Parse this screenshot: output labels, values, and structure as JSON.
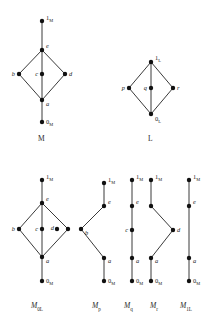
{
  "figure": {
    "type": "hasse-diagram-set",
    "background": "#ffffff",
    "ink": "#1a1a1a",
    "captions": {
      "M": "M",
      "L": "L",
      "M0L": {
        "base": "M",
        "sub": "0",
        "subsub": "L"
      },
      "Mp": {
        "base": "M",
        "sub": "p"
      },
      "Mq": {
        "base": "M",
        "sub": "q"
      },
      "Mr": {
        "base": "M",
        "sub": "r"
      },
      "M1L": {
        "base": "M",
        "sub": "1",
        "subsub": "L"
      }
    },
    "diagrams": [
      {
        "id": "M",
        "caption": "M",
        "caption_pos": {
          "x": 38,
          "y": 140
        },
        "nodes": [
          {
            "id": "one",
            "label": "1",
            "sub": "M",
            "x": 42,
            "y": 21,
            "label_dx": 4,
            "label_dy": -1,
            "anchor": "start"
          },
          {
            "id": "e",
            "label": "e",
            "sub": "",
            "x": 42,
            "y": 50,
            "label_dx": 4,
            "label_dy": -2,
            "anchor": "start"
          },
          {
            "id": "b",
            "label": "b",
            "sub": "",
            "x": 19,
            "y": 74,
            "label_dx": -4,
            "label_dy": 2,
            "anchor": "end"
          },
          {
            "id": "c",
            "label": "c",
            "sub": "",
            "x": 42,
            "y": 74,
            "label_dx": -4,
            "label_dy": 2,
            "anchor": "end"
          },
          {
            "id": "d",
            "label": "d",
            "sub": "",
            "x": 65,
            "y": 74,
            "label_dx": 4,
            "label_dy": 2,
            "anchor": "start"
          },
          {
            "id": "a",
            "label": "a",
            "sub": "",
            "x": 42,
            "y": 100,
            "label_dx": 4,
            "label_dy": 6,
            "anchor": "start"
          },
          {
            "id": "zero",
            "label": "0",
            "sub": "M",
            "x": 42,
            "y": 122,
            "label_dx": 4,
            "label_dy": 2,
            "anchor": "start"
          }
        ],
        "edges": [
          [
            "one",
            "e"
          ],
          [
            "e",
            "b"
          ],
          [
            "e",
            "c"
          ],
          [
            "e",
            "d"
          ],
          [
            "b",
            "a"
          ],
          [
            "c",
            "a"
          ],
          [
            "d",
            "a"
          ],
          [
            "a",
            "zero"
          ]
        ]
      },
      {
        "id": "L",
        "caption": "L",
        "caption_pos": {
          "x": 148,
          "y": 140
        },
        "nodes": [
          {
            "id": "one",
            "label": "1",
            "sub": "L",
            "x": 151,
            "y": 62,
            "label_dx": 4,
            "label_dy": -2,
            "anchor": "start"
          },
          {
            "id": "p",
            "label": "p",
            "sub": "",
            "x": 129,
            "y": 88,
            "label_dx": -4,
            "label_dy": 2,
            "anchor": "end"
          },
          {
            "id": "q",
            "label": "q",
            "sub": "",
            "x": 151,
            "y": 88,
            "label_dx": -4,
            "label_dy": 2,
            "anchor": "end"
          },
          {
            "id": "r",
            "label": "r",
            "sub": "",
            "x": 173,
            "y": 88,
            "label_dx": 4,
            "label_dy": 2,
            "anchor": "start"
          },
          {
            "id": "zero",
            "label": "0",
            "sub": "L",
            "x": 151,
            "y": 114,
            "label_dx": 4,
            "label_dy": 7,
            "anchor": "start"
          }
        ],
        "edges": [
          [
            "one",
            "p"
          ],
          [
            "one",
            "q"
          ],
          [
            "one",
            "r"
          ],
          [
            "p",
            "zero"
          ],
          [
            "q",
            "zero"
          ],
          [
            "r",
            "zero"
          ]
        ]
      },
      {
        "id": "M0L",
        "caption_pos": {
          "x": 31,
          "y": 307
        },
        "nodes": [
          {
            "id": "one",
            "label": "1",
            "sub": "M",
            "x": 42,
            "y": 180,
            "label_dx": 4,
            "label_dy": -1,
            "anchor": "start"
          },
          {
            "id": "e",
            "label": "e",
            "sub": "",
            "x": 42,
            "y": 203,
            "label_dx": 4,
            "label_dy": -2,
            "anchor": "start"
          },
          {
            "id": "b",
            "label": "b",
            "sub": "",
            "x": 19,
            "y": 229,
            "label_dx": -4,
            "label_dy": 2,
            "anchor": "end"
          },
          {
            "id": "c",
            "label": "c",
            "sub": "",
            "x": 42,
            "y": 229,
            "label_dx": -4,
            "label_dy": 2,
            "anchor": "end"
          },
          {
            "id": "d",
            "label": "d",
            "sub": "",
            "x": 57,
            "y": 229,
            "label_dx": -3,
            "label_dy": 1,
            "anchor": "end"
          },
          {
            "id": "dx",
            "label": "",
            "sub": "",
            "x": 68,
            "y": 229,
            "label_dx": 0,
            "label_dy": 0,
            "anchor": "start"
          },
          {
            "id": "a",
            "label": "a",
            "sub": "",
            "x": 42,
            "y": 257,
            "label_dx": 4,
            "label_dy": 6,
            "anchor": "start"
          },
          {
            "id": "zero",
            "label": "0",
            "sub": "M",
            "x": 42,
            "y": 281,
            "label_dx": 4,
            "label_dy": 2,
            "anchor": "start"
          }
        ],
        "edges": [
          [
            "one",
            "e"
          ],
          [
            "e",
            "b"
          ],
          [
            "e",
            "c"
          ],
          [
            "e",
            "dx"
          ],
          [
            "b",
            "a"
          ],
          [
            "c",
            "a"
          ],
          [
            "dx",
            "a"
          ],
          [
            "a",
            "zero"
          ]
        ]
      },
      {
        "id": "Mp",
        "caption_pos": {
          "x": 92,
          "y": 307
        },
        "nodes": [
          {
            "id": "one",
            "label": "1",
            "sub": "M",
            "x": 104,
            "y": 183,
            "label_dx": 4,
            "label_dy": -1,
            "anchor": "start"
          },
          {
            "id": "e",
            "label": "e",
            "sub": "",
            "x": 104,
            "y": 206,
            "label_dx": 4,
            "label_dy": -2,
            "anchor": "start"
          },
          {
            "id": "b",
            "label": "b",
            "sub": "",
            "x": 81,
            "y": 229,
            "label_dx": 4,
            "label_dy": 6,
            "anchor": "start"
          },
          {
            "id": "a",
            "label": "a",
            "sub": "",
            "x": 104,
            "y": 258,
            "label_dx": 4,
            "label_dy": 5,
            "anchor": "start"
          },
          {
            "id": "zero",
            "label": "0",
            "sub": "M",
            "x": 104,
            "y": 281,
            "label_dx": 4,
            "label_dy": 2,
            "anchor": "start"
          }
        ],
        "edges": [
          [
            "one",
            "e"
          ],
          [
            "e",
            "b"
          ],
          [
            "b",
            "a"
          ],
          [
            "a",
            "zero"
          ]
        ]
      },
      {
        "id": "Mq",
        "caption_pos": {
          "x": 124,
          "y": 307
        },
        "nodes": [
          {
            "id": "one",
            "label": "1",
            "sub": "M",
            "x": 132,
            "y": 180,
            "label_dx": 4,
            "label_dy": -1,
            "anchor": "start"
          },
          {
            "id": "e",
            "label": "e",
            "sub": "",
            "x": 132,
            "y": 206,
            "label_dx": 4,
            "label_dy": -2,
            "anchor": "start"
          },
          {
            "id": "c",
            "label": "c",
            "sub": "",
            "x": 132,
            "y": 230,
            "label_dx": -4,
            "label_dy": 2,
            "anchor": "end"
          },
          {
            "id": "a",
            "label": "a",
            "sub": "",
            "x": 132,
            "y": 258,
            "label_dx": 4,
            "label_dy": 5,
            "anchor": "start"
          },
          {
            "id": "zero",
            "label": "0",
            "sub": "M",
            "x": 132,
            "y": 281,
            "label_dx": 4,
            "label_dy": 2,
            "anchor": "start"
          }
        ],
        "edges": [
          [
            "one",
            "e"
          ],
          [
            "e",
            "c"
          ],
          [
            "c",
            "a"
          ],
          [
            "a",
            "zero"
          ]
        ]
      },
      {
        "id": "Mr",
        "caption_pos": {
          "x": 150,
          "y": 307
        },
        "nodes": [
          {
            "id": "one",
            "label": "1",
            "sub": "M",
            "x": 151,
            "y": 180,
            "label_dx": 4,
            "label_dy": -1,
            "anchor": "start"
          },
          {
            "id": "e",
            "label": "",
            "sub": "",
            "x": 151,
            "y": 206,
            "label_dx": 0,
            "label_dy": 0,
            "anchor": "start"
          },
          {
            "id": "d",
            "label": "d",
            "sub": "",
            "x": 173,
            "y": 230,
            "label_dx": 4,
            "label_dy": 2,
            "anchor": "start"
          },
          {
            "id": "a",
            "label": "a",
            "sub": "",
            "x": 151,
            "y": 258,
            "label_dx": 4,
            "label_dy": 5,
            "anchor": "start"
          },
          {
            "id": "zero",
            "label": "0",
            "sub": "M",
            "x": 151,
            "y": 281,
            "label_dx": 4,
            "label_dy": 2,
            "anchor": "start"
          }
        ],
        "edges": [
          [
            "one",
            "e"
          ],
          [
            "e",
            "d"
          ],
          [
            "d",
            "a"
          ],
          [
            "a",
            "zero"
          ]
        ]
      },
      {
        "id": "M1L",
        "caption_pos": {
          "x": 180,
          "y": 307
        },
        "nodes": [
          {
            "id": "one",
            "label": "1",
            "sub": "M",
            "x": 189,
            "y": 180,
            "label_dx": 4,
            "label_dy": -1,
            "anchor": "start"
          },
          {
            "id": "e",
            "label": "e",
            "sub": "",
            "x": 189,
            "y": 206,
            "label_dx": 4,
            "label_dy": -2,
            "anchor": "start"
          },
          {
            "id": "a",
            "label": "a",
            "sub": "",
            "x": 189,
            "y": 258,
            "label_dx": 4,
            "label_dy": 5,
            "anchor": "start"
          },
          {
            "id": "zero",
            "label": "0",
            "sub": "M",
            "x": 189,
            "y": 281,
            "label_dx": 4,
            "label_dy": 2,
            "anchor": "start"
          }
        ],
        "edges": [
          [
            "one",
            "e"
          ],
          [
            "e",
            "a"
          ],
          [
            "a",
            "zero"
          ]
        ]
      }
    ]
  }
}
